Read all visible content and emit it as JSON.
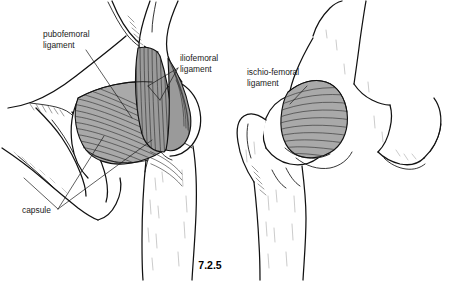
{
  "figure": {
    "number": "7.2.5",
    "background_color": "#ffffff",
    "ink_color": "#111111",
    "ligament_shade_color": "#a9a9a9",
    "ligament_shade_color_dark": "#9a9a9a"
  },
  "labels": {
    "pubofemoral": {
      "line1": "pubofemoral",
      "line2": "ligament",
      "x": 43,
      "y": 36
    },
    "iliofemoral": {
      "line1": "iliofemoral",
      "line2": "ligament",
      "x": 180,
      "y": 60
    },
    "capsule": {
      "line1": "capsule",
      "x": 22,
      "y": 214
    },
    "ischiofemoral": {
      "line1": "ischio-femoral",
      "line2": "ligament",
      "x": 247,
      "y": 74
    }
  },
  "views": {
    "left": {
      "name": "anterior-hip-view",
      "description": "Anterior view of right hip joint showing pubofemoral and iliofemoral ligaments and capsule"
    },
    "right": {
      "name": "posterior-hip-view",
      "description": "Posterior view of right hip joint showing ischio-femoral ligament"
    }
  }
}
